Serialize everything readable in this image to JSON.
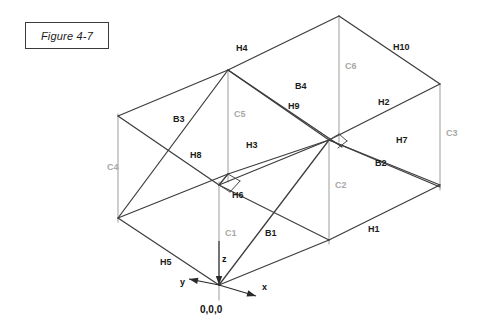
{
  "figure": {
    "caption": "Figure 4-7"
  },
  "diagram": {
    "origin_label": "0,0,0",
    "colors": {
      "beam": "#3d3d3d",
      "column": "#b9b9b9",
      "column_label": "#a8a8a8",
      "beam_label": "#1b1b1b",
      "axis": "#2a2a2a",
      "background": "#ffffff"
    },
    "axes": [
      {
        "id": "axis-z",
        "label": "z",
        "label_x": 222,
        "label_y": 262,
        "x1": 219,
        "y1": 241,
        "x2": 219,
        "y2": 285,
        "arrow": "down"
      },
      {
        "id": "axis-x",
        "label": "x",
        "label_x": 262,
        "label_y": 290,
        "x1": 219,
        "y1": 285,
        "x2": 256,
        "y2": 296,
        "arrow": "outward"
      },
      {
        "id": "axis-y",
        "label": "y",
        "label_x": 180,
        "label_y": 285,
        "x1": 219,
        "y1": 285,
        "x2": 189,
        "y2": 279,
        "arrow": "outward"
      }
    ],
    "beam_labels": [
      {
        "id": "H4",
        "text": "H4",
        "x": 236,
        "y": 51
      },
      {
        "id": "H10",
        "text": "H10",
        "x": 393,
        "y": 50
      },
      {
        "id": "B4",
        "text": "B4",
        "x": 295,
        "y": 89
      },
      {
        "id": "H9",
        "text": "H9",
        "x": 288,
        "y": 109
      },
      {
        "id": "H2",
        "text": "H2",
        "x": 378,
        "y": 105
      },
      {
        "id": "B3",
        "text": "B3",
        "x": 173,
        "y": 122
      },
      {
        "id": "H7",
        "text": "H7",
        "x": 396,
        "y": 143
      },
      {
        "id": "H8",
        "text": "H8",
        "x": 190,
        "y": 158
      },
      {
        "id": "H3",
        "text": "H3",
        "x": 246,
        "y": 148
      },
      {
        "id": "B2",
        "text": "B2",
        "x": 375,
        "y": 166
      },
      {
        "id": "H6",
        "text": "H6",
        "x": 232,
        "y": 198
      },
      {
        "id": "B1",
        "text": "B1",
        "x": 265,
        "y": 236
      },
      {
        "id": "H1",
        "text": "H1",
        "x": 368,
        "y": 232
      },
      {
        "id": "H5",
        "text": "H5",
        "x": 160,
        "y": 265
      }
    ],
    "column_labels": [
      {
        "id": "C6",
        "text": "C6",
        "x": 345,
        "y": 69
      },
      {
        "id": "C3",
        "text": "C3",
        "x": 446,
        "y": 136
      },
      {
        "id": "C5",
        "text": "C5",
        "x": 234,
        "y": 117
      },
      {
        "id": "C4",
        "text": "C4",
        "x": 107,
        "y": 170
      },
      {
        "id": "C2",
        "text": "C2",
        "x": 335,
        "y": 188
      },
      {
        "id": "C1",
        "text": "C1",
        "x": 225,
        "y": 236
      }
    ],
    "columns": [
      {
        "id": "C5",
        "x1": 228,
        "y1": 70,
        "x2": 228,
        "y2": 182
      },
      {
        "id": "C1",
        "x1": 219,
        "y1": 182,
        "x2": 219,
        "y2": 300
      },
      {
        "id": "C6",
        "x1": 339,
        "y1": 16,
        "x2": 339,
        "y2": 142
      },
      {
        "id": "C2",
        "x1": 329,
        "y1": 142,
        "x2": 329,
        "y2": 244
      },
      {
        "id": "C3",
        "x1": 440,
        "y1": 84,
        "x2": 440,
        "y2": 190
      },
      {
        "id": "C4",
        "x1": 118,
        "y1": 114,
        "x2": 118,
        "y2": 222
      }
    ],
    "beams": [
      {
        "id": "H4",
        "x1": 118,
        "y1": 116,
        "x2": 228,
        "y2": 70
      },
      {
        "id": "H4b",
        "x1": 228,
        "y1": 70,
        "x2": 339,
        "y2": 16
      },
      {
        "id": "H10",
        "x1": 339,
        "y1": 16,
        "x2": 440,
        "y2": 84
      },
      {
        "id": "H2",
        "x1": 440,
        "y1": 84,
        "x2": 329,
        "y2": 140
      },
      {
        "id": "H3",
        "x1": 329,
        "y1": 140,
        "x2": 219,
        "y2": 185
      },
      {
        "id": "H3b",
        "x1": 219,
        "y1": 185,
        "x2": 118,
        "y2": 116
      },
      {
        "id": "H8",
        "x1": 118,
        "y1": 218,
        "x2": 228,
        "y2": 174
      },
      {
        "id": "H8b",
        "x1": 228,
        "y1": 174,
        "x2": 329,
        "y2": 140
      },
      {
        "id": "H1",
        "x1": 440,
        "y1": 185,
        "x2": 329,
        "y2": 240
      },
      {
        "id": "H1b",
        "x1": 329,
        "y1": 240,
        "x2": 219,
        "y2": 285
      },
      {
        "id": "H5",
        "x1": 219,
        "y1": 285,
        "x2": 118,
        "y2": 218
      },
      {
        "id": "H7",
        "x1": 329,
        "y1": 140,
        "x2": 440,
        "y2": 185
      },
      {
        "id": "B3",
        "x1": 118,
        "y1": 218,
        "x2": 228,
        "y2": 70
      },
      {
        "id": "B4",
        "x1": 228,
        "y1": 70,
        "x2": 329,
        "y2": 140
      },
      {
        "id": "H9",
        "x1": 228,
        "y1": 70,
        "x2": 342,
        "y2": 147
      },
      {
        "id": "B1",
        "x1": 219,
        "y1": 285,
        "x2": 329,
        "y2": 140
      },
      {
        "id": "B2",
        "x1": 329,
        "y1": 140,
        "x2": 440,
        "y2": 187
      },
      {
        "id": "H6",
        "x1": 219,
        "y1": 185,
        "x2": 329,
        "y2": 240
      },
      {
        "id": "H6b",
        "x1": 228,
        "y1": 174,
        "x2": 219,
        "y2": 185
      },
      {
        "id": "mid1",
        "x1": 219,
        "y1": 185,
        "x2": 228,
        "y2": 174
      },
      {
        "id": "mid2",
        "x1": 228,
        "y1": 174,
        "x2": 240,
        "y2": 181
      },
      {
        "id": "mid3",
        "x1": 240,
        "y1": 181,
        "x2": 230,
        "y2": 192
      },
      {
        "id": "mid4",
        "x1": 230,
        "y1": 192,
        "x2": 219,
        "y2": 185
      },
      {
        "id": "mid5",
        "x1": 329,
        "y1": 140,
        "x2": 339,
        "y2": 134
      },
      {
        "id": "mid6",
        "x1": 339,
        "y1": 134,
        "x2": 347,
        "y2": 141
      },
      {
        "id": "mid7",
        "x1": 347,
        "y1": 141,
        "x2": 338,
        "y2": 148
      }
    ]
  }
}
